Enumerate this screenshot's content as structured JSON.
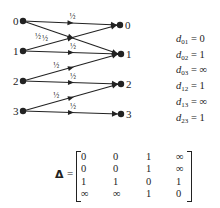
{
  "graph": {
    "left_nodes": [
      {
        "label": "0",
        "x": 23,
        "y": 21
      },
      {
        "label": "1",
        "x": 23,
        "y": 51
      },
      {
        "label": "2",
        "x": 23,
        "y": 81
      },
      {
        "label": "3",
        "x": 23,
        "y": 111
      }
    ],
    "right_nodes": [
      {
        "label": "0",
        "x": 120,
        "y": 25
      },
      {
        "label": "1",
        "x": 121,
        "y": 54
      },
      {
        "label": "2",
        "x": 121,
        "y": 84
      },
      {
        "label": "3",
        "x": 121,
        "y": 114
      }
    ],
    "edges": [
      {
        "from": 0,
        "to": 0,
        "weight": "½"
      },
      {
        "from": 0,
        "to": 1,
        "weight": "½"
      },
      {
        "from": 1,
        "to": 0,
        "weight": "½"
      },
      {
        "from": 1,
        "to": 1,
        "weight": "½"
      },
      {
        "from": 2,
        "to": 1,
        "weight": "½"
      },
      {
        "from": 2,
        "to": 2,
        "weight": "½"
      },
      {
        "from": 3,
        "to": 2,
        "weight": "½"
      },
      {
        "from": 3,
        "to": 3,
        "weight": "½"
      }
    ],
    "line_color": "#222222"
  },
  "distances": [
    {
      "sub": "01",
      "value": "0"
    },
    {
      "sub": "02",
      "value": "1"
    },
    {
      "sub": "03",
      "value": "∞"
    },
    {
      "sub": "12",
      "value": "1"
    },
    {
      "sub": "13",
      "value": "∞"
    },
    {
      "sub": "23",
      "value": "1"
    }
  ],
  "matrix": {
    "symbol": "Δ",
    "equals": "=",
    "rows": [
      [
        "0",
        "0",
        "1",
        "∞"
      ],
      [
        "0",
        "0",
        "1",
        "∞"
      ],
      [
        "1",
        "1",
        "0",
        "1"
      ],
      [
        "∞",
        "∞",
        "1",
        "0"
      ]
    ]
  }
}
